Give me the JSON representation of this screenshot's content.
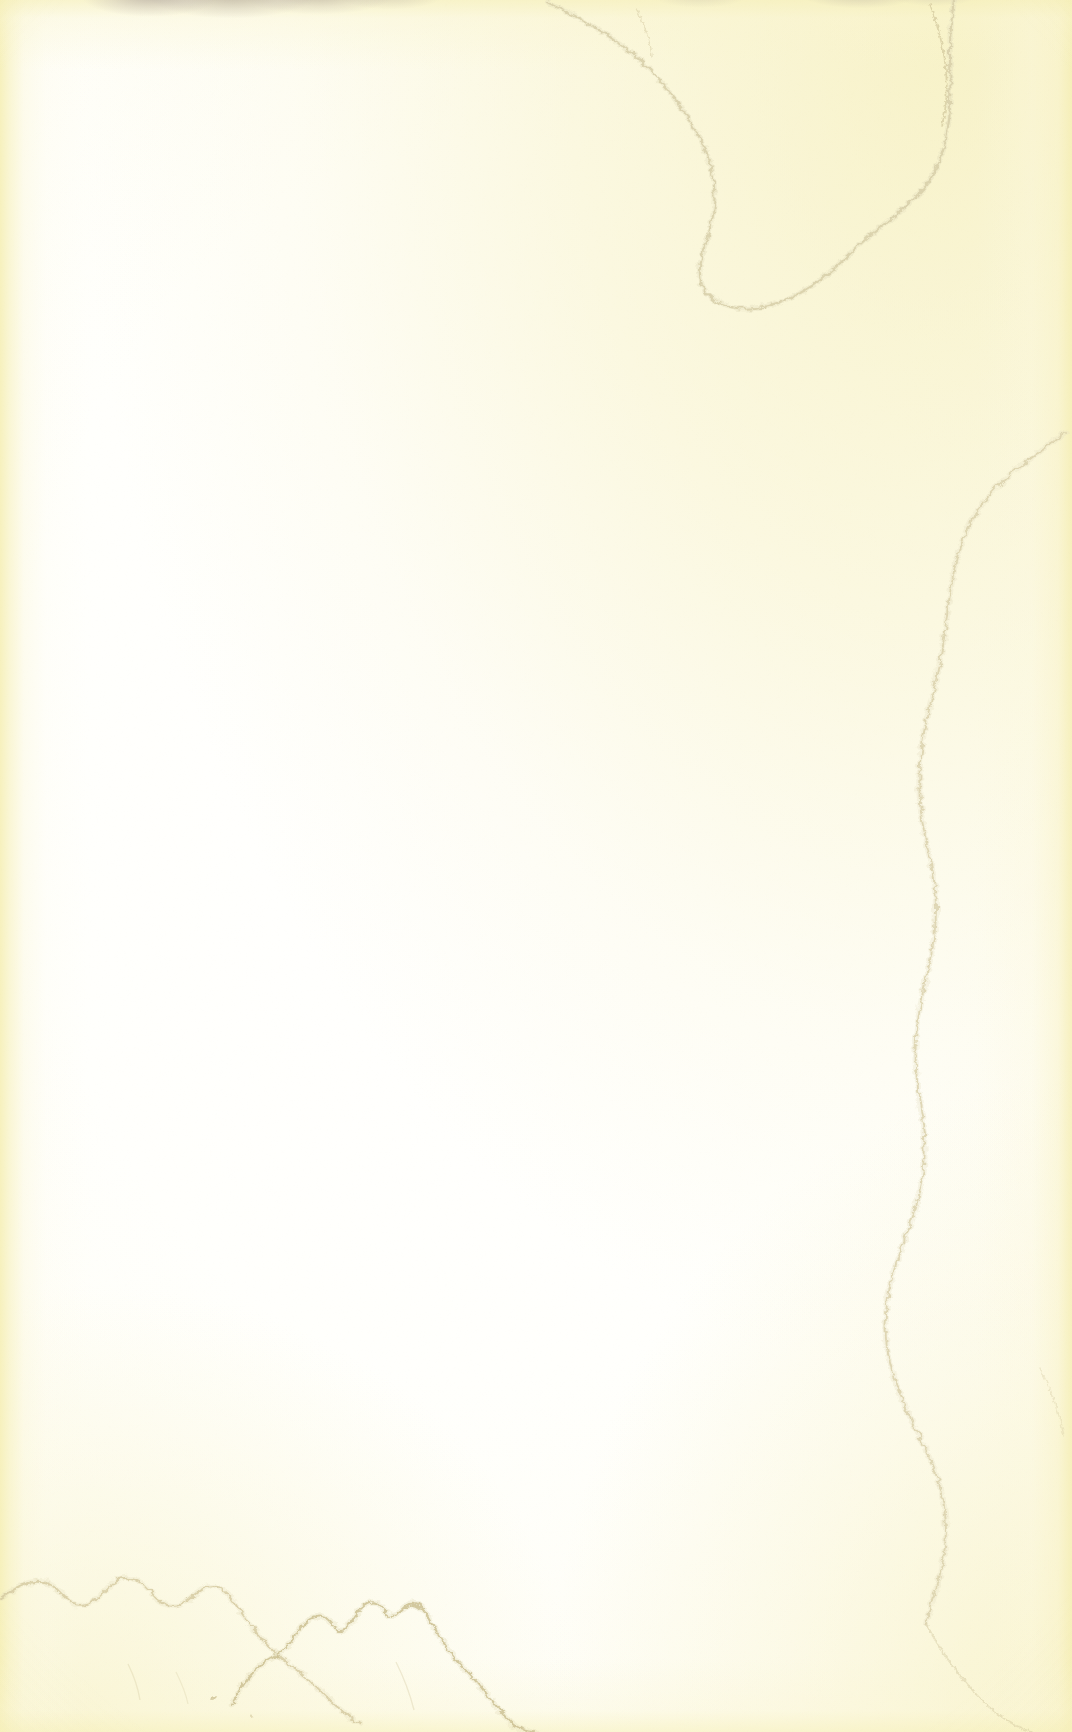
{
  "image": {
    "subject": "blank aged paper page",
    "kind": "scanned book flyleaf / endpaper",
    "width": 1072,
    "height": 1732,
    "has_text": false,
    "has_graphics": false,
    "orientation": "portrait"
  },
  "paper": {
    "base_color": "#fffffd",
    "center_color": "#fffffe",
    "edge_color": "#faf6d6",
    "warm_cream": "#fcfbe8",
    "description": "Near-white blank leaf warming to cream toward every margin."
  },
  "colors": {
    "tideline_ochre": "#d4c9a0",
    "tideline_dark": "#c2b483",
    "stain_yellow": "#f3eaac",
    "stain_yellow_soft": "#f8f2c8",
    "smudge_grey_violet": "#9a8e94",
    "vignette": "#e2d8ac"
  },
  "features": [
    {
      "id": "top-right-tideline",
      "label": "Top-right water tideline",
      "description": "Large crenellated tideline sweeping from the top edge near x=560 down and right, enclosing a yellowed corner field.",
      "region": "top-right"
    },
    {
      "id": "right-edge-tideline",
      "label": "Right-edge vertical tideline",
      "description": "Thin meandering ochre line running vertically from about y=430 to y=1620 near x=925-960.",
      "region": "right"
    },
    {
      "id": "bottom-left-tidelines",
      "label": "Bottom-left tideline arcs",
      "description": "Two scalloped arched tidelines with small wavy crests across the lower-left quadrant.",
      "region": "bottom-left"
    },
    {
      "id": "top-edge-smudges",
      "label": "Top edge grey-violet smudges",
      "description": "Soft grey-violet handling marks bleeding in from the very top edge between x=120 and x=400.",
      "region": "top"
    },
    {
      "id": "left-edge-wash",
      "label": "Left margin yellow wash",
      "description": "Soft yellow gradient band along the left edge fading inward.",
      "region": "left"
    },
    {
      "id": "bottom-right-wash",
      "label": "Bottom-right yellow wash",
      "description": "Diffuse yellow discolouration at the bottom-right corner.",
      "region": "bottom-right"
    }
  ]
}
